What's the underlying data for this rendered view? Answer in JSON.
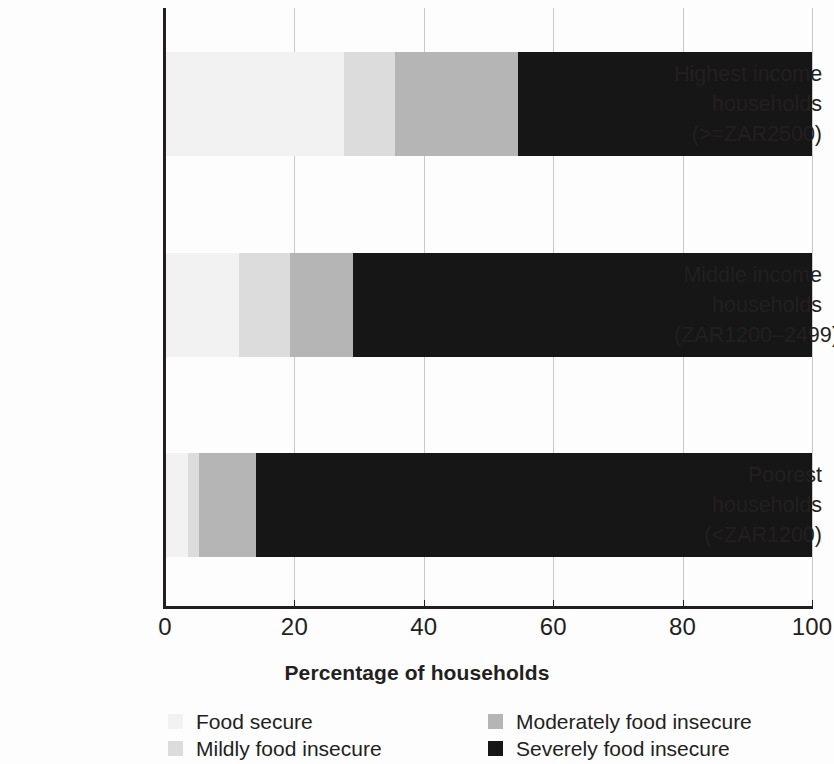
{
  "chart_data": {
    "type": "bar",
    "orientation": "horizontal",
    "stacked": true,
    "stack_mode": "percent",
    "title": "",
    "xlabel": "Percentage of households",
    "ylabel": "",
    "xlim": [
      0,
      100
    ],
    "xticks": [
      0,
      20,
      40,
      60,
      80,
      100
    ],
    "xticklabels": [
      "0",
      "20",
      "40",
      "60",
      "80",
      "100"
    ],
    "grid": "vertical",
    "legend_position": "bottom",
    "categories": [
      "Highest income households (>=ZAR2500)",
      "Middle income households (ZAR1200–2499)",
      "Poorest households (<ZAR1200)"
    ],
    "category_lines": [
      [
        "Highest income",
        "households",
        "(>=ZAR2500)"
      ],
      [
        "Middle income",
        "households",
        "(ZAR1200–2499)"
      ],
      [
        "Poorest",
        "households",
        "(<ZAR1200)"
      ]
    ],
    "series": [
      {
        "name": "Food secure",
        "color": "#f2f2f2",
        "values": [
          27.7,
          11.4,
          3.6
        ]
      },
      {
        "name": "Mildly food insecure",
        "color": "#dcdcdc",
        "values": [
          7.8,
          7.9,
          1.7
        ]
      },
      {
        "name": "Moderately food insecure",
        "color": "#b5b5b5",
        "values": [
          19.1,
          9.7,
          8.7
        ]
      },
      {
        "name": "Severely food insecure",
        "color": "#161616",
        "values": [
          45.4,
          71.0,
          86.0
        ]
      }
    ]
  },
  "axis": {
    "x_title": "Percentage of households",
    "tick_labels": [
      "0",
      "20",
      "40",
      "60",
      "80",
      "100"
    ]
  },
  "legend": {
    "entries": [
      {
        "label": "Food secure",
        "color": "#f2f2f2"
      },
      {
        "label": "Moderately food insecure",
        "color": "#b5b5b5"
      },
      {
        "label": "Mildly food insecure",
        "color": "#dcdcdc"
      },
      {
        "label": "Severely food insecure",
        "color": "#161616"
      }
    ]
  }
}
